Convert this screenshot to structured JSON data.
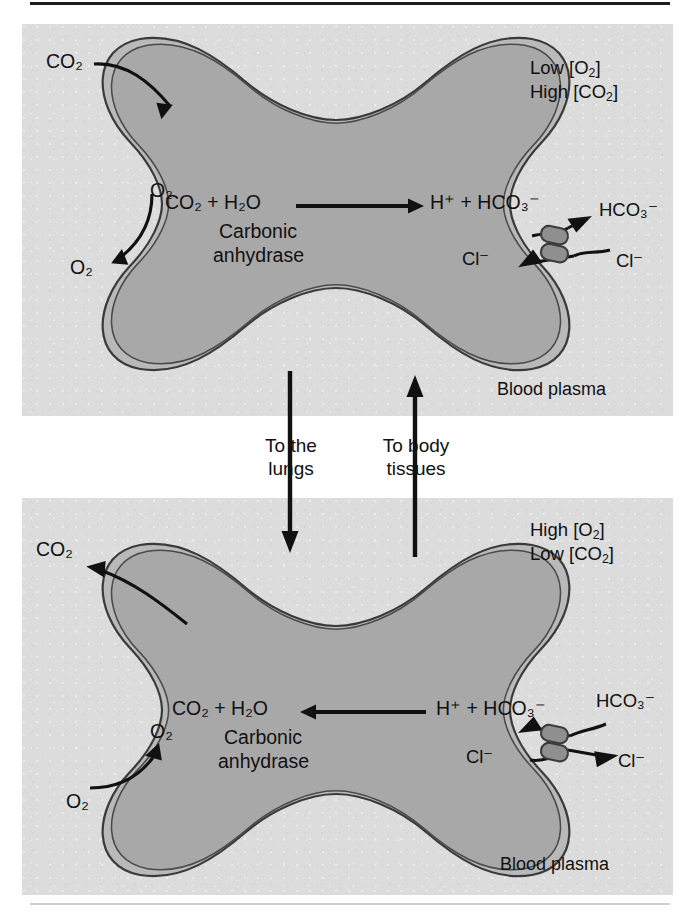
{
  "figure": {
    "title_rule": true,
    "colors": {
      "panel_bg": "#dcdcdc",
      "cytoplasm": "#a8a8a8",
      "membrane_band": "#b9b9b9",
      "membrane_line": "#3a3a3a",
      "protein_fill": "#8f8f8f",
      "ink": "#111111"
    }
  },
  "panels": [
    {
      "id": "top",
      "name": "systemic-capillary-panel",
      "conditions": {
        "line1_prefix": "Low [O",
        "line1_sub": "2",
        "line1_suffix": "]",
        "line2_prefix": "High [CO",
        "line2_sub": "2",
        "line2_suffix": "]"
      },
      "environment_label": "Blood plasma",
      "cell": {
        "name": "erythrocyte",
        "reaction_left": {
          "text": "CO2 + H2O",
          "display": "CO₂ + H₂O"
        },
        "reaction_right": {
          "text": "H+ + HCO3-",
          "display": "H⁺ + HCO₃⁻"
        },
        "enzyme_line1": "Carbonic",
        "enzyme_line2": "anhydrase",
        "reaction_direction": "right"
      },
      "gas_arrows": [
        {
          "species": "CO2",
          "label": "CO₂",
          "direction": "in",
          "name": "co2-influx-arrow"
        },
        {
          "species": "O2",
          "label_inside": "O₂",
          "label_outside": "O₂",
          "direction": "out",
          "name": "o2-efflux-arrow"
        }
      ],
      "exchanger": {
        "name": "chloride-bicarbonate-exchanger",
        "inside_ion": "Cl⁻",
        "outside_ion": "Cl⁻",
        "inside_exit_ion_label": "HCO₃⁻",
        "outside_ion_label": "HCO₃⁻",
        "bicarbonate_direction": "out",
        "chloride_direction": "in"
      }
    },
    {
      "id": "bottom",
      "name": "pulmonary-capillary-panel",
      "conditions": {
        "line1_prefix": "High [O",
        "line1_sub": "2",
        "line1_suffix": "]",
        "line2_prefix": "Low [CO",
        "line2_sub": "2",
        "line2_suffix": "]"
      },
      "environment_label": "Blood plasma",
      "cell": {
        "name": "erythrocyte",
        "reaction_left": {
          "text": "CO2 + H2O",
          "display": "CO₂ + H₂O"
        },
        "reaction_right": {
          "text": "H+ + HCO3-",
          "display": "H⁺ + HCO₃⁻"
        },
        "enzyme_line1": "Carbonic",
        "enzyme_line2": "anhydrase",
        "reaction_direction": "left"
      },
      "gas_arrows": [
        {
          "species": "CO2",
          "label": "CO₂",
          "direction": "out",
          "name": "co2-efflux-arrow"
        },
        {
          "species": "O2",
          "label_inside": "O₂",
          "label_outside": "O₂",
          "direction": "in",
          "name": "o2-influx-arrow"
        }
      ],
      "exchanger": {
        "name": "chloride-bicarbonate-exchanger",
        "inside_ion": "Cl⁻",
        "outside_ion": "Cl⁻",
        "inside_exit_ion_label": "HCO₃⁻",
        "outside_ion_label": "HCO₃⁻",
        "bicarbonate_direction": "in",
        "chloride_direction": "out"
      }
    }
  ],
  "flow": {
    "to_lungs": {
      "line1": "To the",
      "line2": "lungs",
      "direction": "down",
      "name": "to-lungs-flow"
    },
    "to_tissues": {
      "line1": "To body",
      "line2": "tissues",
      "direction": "up",
      "name": "to-body-tissues-flow"
    }
  }
}
